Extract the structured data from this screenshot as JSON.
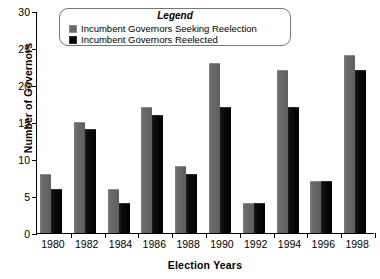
{
  "chart_data": {
    "type": "bar",
    "title": "",
    "xlabel": "Election Years",
    "ylabel": "Number of Governors",
    "categories": [
      "1980",
      "1982",
      "1984",
      "1986",
      "1988",
      "1990",
      "1992",
      "1994",
      "1996",
      "1998"
    ],
    "series": [
      {
        "name": "Incumbent Governors Seeking Reelection",
        "color": "#6a6a6a",
        "values": [
          8,
          15,
          6,
          17,
          9,
          23,
          4,
          22,
          7,
          24
        ]
      },
      {
        "name": "Incumbent Governors Reelected",
        "color": "#000000",
        "values": [
          6,
          14,
          4,
          16,
          8,
          17,
          4,
          17,
          7,
          22
        ]
      }
    ],
    "ylim": [
      0,
      30
    ],
    "yticks": [
      0,
      5,
      10,
      15,
      20,
      25,
      30
    ],
    "ytick_labels": [
      "0",
      "5",
      "10",
      "15",
      "20",
      "25",
      "30"
    ],
    "grid": false,
    "legend_position": "top-center"
  },
  "legend": {
    "title": "Legend",
    "entries": [
      {
        "label": "Incumbent Governors Seeking Reelection",
        "swatch": "seeking"
      },
      {
        "label": "Incumbent Governors Reelected",
        "swatch": "reelected"
      }
    ]
  },
  "axes": {
    "y_title": "Number of Governors",
    "x_title": "Election Years"
  }
}
